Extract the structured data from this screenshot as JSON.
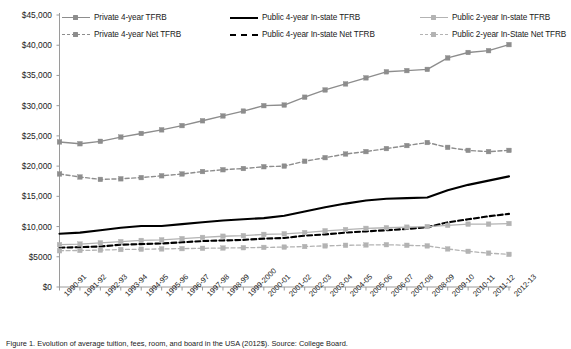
{
  "figure": {
    "caption": "Figure 1. Evolution of average tuition, fees, room, and board in the USA (2012$). Source: College Board."
  },
  "legend": {
    "position": "top",
    "items": [
      {
        "label": "Private 4-year TFRB",
        "style": "solid",
        "color": "#8d8d8d",
        "marker": "square",
        "key": "key-gs",
        "mk": "mk-g"
      },
      {
        "label": "Public 4-year In-state TFRB",
        "style": "solid",
        "color": "#000000",
        "marker": "none",
        "key": "key-ks",
        "mk": ""
      },
      {
        "label": "Public 2-year In-state TFRB",
        "style": "solid",
        "color": "#b3b3b3",
        "marker": "square",
        "key": "key-ls",
        "mk": "mk-l"
      },
      {
        "label": "Private 4-year Net TFRB",
        "style": "dashed",
        "color": "#8d8d8d",
        "marker": "square",
        "key": "key-gd",
        "mk": "mk-g"
      },
      {
        "label": "Public 4-year In-state Net TFRB",
        "style": "dashed",
        "color": "#000000",
        "marker": "none",
        "key": "key-kd",
        "mk": ""
      },
      {
        "label": "Public 2-year In-State Net TFRB",
        "style": "dashed",
        "color": "#b3b3b3",
        "marker": "square",
        "key": "key-ld",
        "mk": "mk-l"
      }
    ]
  },
  "axes": {
    "y_ticks": [
      "$45,000",
      "$40,000",
      "$35,000",
      "$30,000",
      "$25,000",
      "$20,000",
      "$15,000",
      "$10,000",
      "$5000",
      "$0"
    ],
    "y_values": [
      45000,
      40000,
      35000,
      30000,
      25000,
      20000,
      15000,
      10000,
      5000,
      0
    ],
    "x_ticks": [
      "1990-91",
      "1991-92",
      "1992-93",
      "1993-94",
      "1994-95",
      "1995-96",
      "1996-97",
      "1997-98",
      "1998-99",
      "1999-2000",
      "2000-01",
      "2001-02",
      "2002-03",
      "2003-04",
      "2004-05",
      "2005-06",
      "2006-07",
      "2007-08",
      "2008-09",
      "2009-10",
      "2010-11",
      "2011-12",
      "2012-13"
    ]
  },
  "chart_data": {
    "type": "line",
    "title": "",
    "xlabel": "",
    "ylabel": "",
    "ylim": [
      0,
      45000
    ],
    "grid": false,
    "legend_position": "top",
    "categories": [
      "1990-91",
      "1991-92",
      "1992-93",
      "1993-94",
      "1994-95",
      "1995-96",
      "1996-97",
      "1997-98",
      "1998-99",
      "1999-2000",
      "2000-01",
      "2001-02",
      "2002-03",
      "2003-04",
      "2004-05",
      "2005-06",
      "2006-07",
      "2007-08",
      "2008-09",
      "2009-10",
      "2010-11",
      "2011-12",
      "2012-13"
    ],
    "series": [
      {
        "name": "Private 4-year TFRB",
        "color": "#8d8d8d",
        "style": "solid",
        "marker": "square",
        "width": 1.4,
        "values": [
          24000,
          23700,
          24100,
          24800,
          25400,
          26000,
          26700,
          27500,
          28300,
          29100,
          30000,
          30100,
          31400,
          32600,
          33600,
          34600,
          35600,
          35800,
          36000,
          37900,
          38800,
          39100,
          40100
        ]
      },
      {
        "name": "Private 4-year Net TFRB",
        "color": "#8d8d8d",
        "style": "dashed",
        "marker": "square",
        "width": 1.4,
        "values": [
          18700,
          18200,
          17800,
          17900,
          18100,
          18400,
          18700,
          19100,
          19400,
          19600,
          19900,
          20000,
          20800,
          21400,
          22000,
          22400,
          22900,
          23400,
          23900,
          23100,
          22600,
          22400,
          22600
        ]
      },
      {
        "name": "Public 4-year In-state TFRB",
        "color": "#000000",
        "style": "solid",
        "marker": "none",
        "width": 2.1,
        "values": [
          8800,
          9000,
          9400,
          9800,
          10100,
          10100,
          10400,
          10700,
          11000,
          11200,
          11400,
          11800,
          12500,
          13200,
          13800,
          14300,
          14600,
          14700,
          14800,
          16000,
          16900,
          17600,
          18300
        ]
      },
      {
        "name": "Public 4-year In-state Net TFRB",
        "color": "#000000",
        "style": "dashed",
        "marker": "none",
        "width": 2.1,
        "values": [
          6500,
          6600,
          6700,
          7000,
          7100,
          7200,
          7400,
          7600,
          7700,
          7800,
          8000,
          8100,
          8500,
          8700,
          9000,
          9200,
          9400,
          9600,
          9900,
          10700,
          11200,
          11700,
          12100
        ]
      },
      {
        "name": "Public 2-year In-state TFRB",
        "color": "#b3b3b3",
        "style": "solid",
        "marker": "square",
        "width": 1.3,
        "values": [
          7000,
          7100,
          7300,
          7500,
          7700,
          7800,
          8000,
          8200,
          8400,
          8500,
          8700,
          8800,
          9000,
          9300,
          9500,
          9700,
          9800,
          9900,
          10000,
          10200,
          10400,
          10400,
          10500
        ]
      },
      {
        "name": "Public 2-year In-State Net TFRB",
        "color": "#b3b3b3",
        "style": "dashed",
        "marker": "square",
        "width": 1.3,
        "values": [
          6000,
          6050,
          6100,
          6200,
          6250,
          6300,
          6350,
          6400,
          6450,
          6500,
          6550,
          6600,
          6700,
          6800,
          6900,
          6950,
          7000,
          6900,
          6800,
          6300,
          5900,
          5600,
          5400
        ]
      }
    ]
  }
}
